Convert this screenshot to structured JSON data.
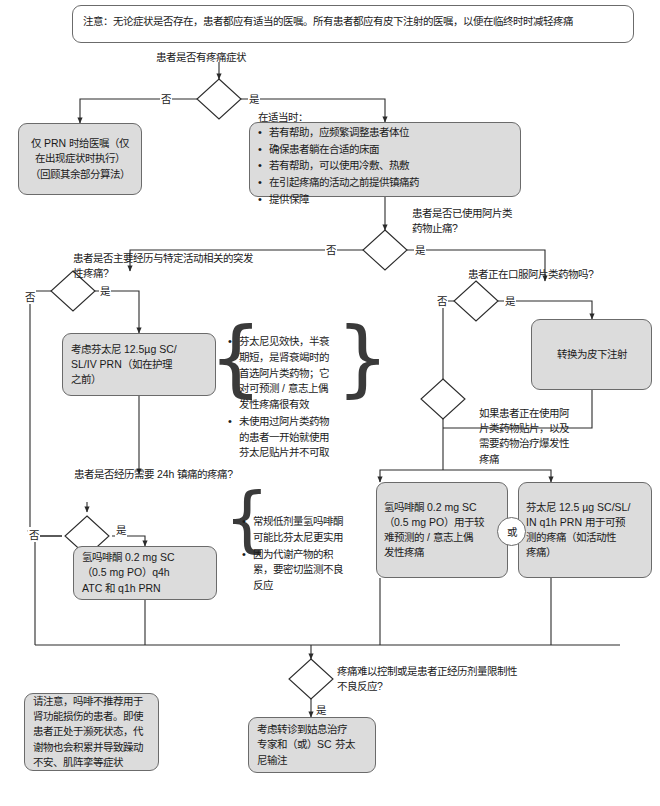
{
  "top_note": {
    "text": "注意：无论症状是否存在，患者都应有适当的医嘱。所有患者都应有皮下注射的医嘱，以便在临终时时减轻疼痛"
  },
  "questions": {
    "q1": "患者是否有疼痛症状",
    "q2": "患者是否已使用阿片类\n药物止痛?",
    "q3": "患者是否主要经历与特定活动相关的突发\n性疼痛?",
    "q4": "患者正在口服阿片类药物吗?",
    "q5": "如果患者正在使用阿\n片类药物贴片，以及\n需要药物治疗爆发性\n疼痛",
    "q6": "患者是否经历需要 24h 镇痛的疼痛?",
    "q7": "疼痛难以控制或是患者正经历剂量限制性\n不良反应?"
  },
  "edges": {
    "no": "否",
    "yes": "是",
    "or": "或"
  },
  "boxes": {
    "prn_only": "仅 PRN 时给医嘱（仅\n在出现症状时执行）\n（回顾其余部分算法）",
    "comfort_measures": {
      "heading": "在适当时：",
      "items": [
        "若有帮助，应频繁调整患者体位",
        "确保患者躺在合适的床面",
        "若有帮助，可以使用冷敷、热敷",
        "在引起疼痛的活动之前提供镇痛药",
        "提供保障"
      ]
    },
    "fentanyl_consider": "考虑芬太尼 12.5µg SC/\nSL/IV PRN（如在护理\n之前）",
    "convert_sc": "转换为皮下注射",
    "hydromorphone_breakthrough": "氢吗啡酮 0.2 mg SC\n（0.5 mg PO）用于较\n难预测的 / 意志上偶\n发性疼痛",
    "fentanyl_predictable": "芬太尼 12.5 µg SC/SL/\nIN q1h PRN 用于可预\n测的疼痛（如活动性\n疼痛）",
    "hydromorphone_atc": "氢吗啡酮 0.2 mg SC\n（0.5 mg PO）q4h\nATC 和 q1h PRN",
    "referral": "考虑转诊到姑息治疗\n专家和（或）SC 芬太\n尼输注"
  },
  "side_notes": {
    "fentanyl_notes": [
      "芬太尼见效快，半衰期短，是肾衰竭时的首选阿片类药物；它对可预测 / 意志上偶发性疼痛很有效",
      "未使用过阿片类药物的患者一开始就使用芬太尼贴片并不可取"
    ],
    "hydromorphone_notes": [
      "常规低剂量氢吗啡酮可能比芬太尼更实用",
      "因为代谢产物的积累，要密切监测不良反应"
    ],
    "morphine_warning": "请注意，吗啡不推荐用于肾功能损伤的患者。即使患者正处于濒死状态，代谢物也会积累并导致躁动不安、肌阵挛等症状"
  },
  "colors": {
    "node_fill": "#dcdcdc",
    "node_border": "#6b6b6b",
    "line": "#2b2b2b",
    "page_bg": "#ffffff"
  }
}
